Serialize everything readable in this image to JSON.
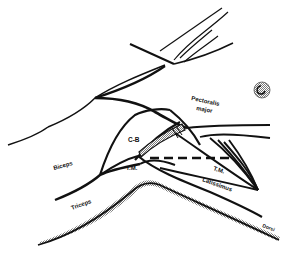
{
  "diagram": {
    "type": "anatomical line drawing",
    "background": "#ffffff",
    "stroke_color": "#111111",
    "shade_color": "#9a9a9a",
    "labels": {
      "pectoralis": "Pectoralis",
      "major": "major",
      "biceps": "Biceps",
      "coracobrachialis": "C-B",
      "teres_major_left": "T.M.",
      "teres_major_right": "T.M.",
      "triceps": "Triceps",
      "latissimus": "Latissimus",
      "dorsi": "Dorsi"
    }
  }
}
